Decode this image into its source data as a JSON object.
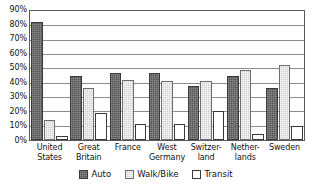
{
  "chart_data": {
    "type": "bar",
    "title": "",
    "subtitle": "",
    "xlabel": "",
    "ylabel": "",
    "ylim": [
      0,
      90
    ],
    "y_tick_step": 10,
    "y_tick_labels": [
      "90%",
      "80%",
      "70%",
      "60%",
      "50%",
      "40%",
      "30%",
      "20%",
      "10%",
      "0%"
    ],
    "y_tick_values": [
      90,
      80,
      70,
      60,
      50,
      40,
      30,
      20,
      10,
      0
    ],
    "grid": true,
    "grid_axis": "y",
    "legend_position": "bottom",
    "value_unit": "percent",
    "categories": [
      "United States",
      "Great Britain",
      "France",
      "West Germany",
      "Switzer-land",
      "Nether-lands",
      "Sweden"
    ],
    "category_labels_wrapped": [
      "United\nStates",
      "Great\nBritain",
      "France",
      "West\nGermany",
      "Switzer-\nland",
      "Nether-\nlands",
      "Sweden"
    ],
    "series": [
      {
        "name": "Auto",
        "color": "#555555",
        "values": [
          82,
          45,
          47,
          47,
          38,
          45,
          36
        ]
      },
      {
        "name": "Walk/Bike",
        "color": "#cfcfcf",
        "values": [
          14,
          36,
          42,
          41,
          41,
          49,
          52
        ]
      },
      {
        "name": "Transit",
        "color": "#ffffff",
        "values": [
          3,
          19,
          11,
          11,
          20,
          4,
          10
        ]
      }
    ]
  },
  "legend": {
    "items": [
      {
        "label": "Auto",
        "swatch": "auto"
      },
      {
        "label": "Walk/Bike",
        "swatch": "walkbike"
      },
      {
        "label": "Transit",
        "swatch": "transit"
      }
    ]
  },
  "colors": {
    "axis": "#5a5a5a",
    "gridline": "#8c8c8c",
    "text": "#111111",
    "background": "#ffffff"
  }
}
